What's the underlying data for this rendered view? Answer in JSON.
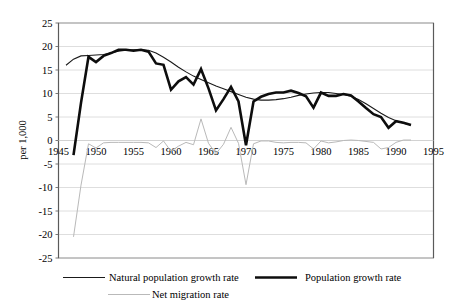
{
  "chart_data": {
    "type": "line",
    "title": "",
    "xlabel": "",
    "ylabel": "per 1,000",
    "xlim": [
      1945,
      1995
    ],
    "ylim": [
      -25,
      25
    ],
    "xticks": [
      "1945",
      "1950",
      "1955",
      "1960",
      "1965",
      "1970",
      "1975",
      "1980",
      "1985",
      "1990",
      "1995"
    ],
    "yticks": [
      "25",
      "20",
      "15",
      "10",
      "5",
      "0",
      "-5",
      "-10",
      "-15",
      "-20",
      "-25"
    ],
    "grid": "horizontal",
    "legend_position": "bottom",
    "series": [
      {
        "name": "Natural population growth rate",
        "style": "thin-black",
        "color": "#1a1a1a",
        "width": 1.1,
        "x": [
          1946,
          1947,
          1948,
          1949,
          1950,
          1951,
          1952,
          1953,
          1954,
          1955,
          1956,
          1957,
          1958,
          1959,
          1960,
          1961,
          1962,
          1963,
          1964,
          1965,
          1966,
          1967,
          1968,
          1969,
          1970,
          1971,
          1972,
          1973,
          1974,
          1975,
          1976,
          1977,
          1978,
          1979,
          1980,
          1981,
          1982,
          1983,
          1984,
          1985,
          1986,
          1987,
          1988,
          1989,
          1990,
          1991,
          1992
        ],
        "values": [
          16.0,
          17.3,
          18.0,
          18.1,
          18.2,
          18.3,
          18.6,
          19.0,
          19.2,
          19.3,
          19.3,
          19.2,
          18.6,
          17.7,
          16.7,
          15.6,
          14.6,
          13.7,
          13.0,
          12.3,
          11.6,
          11.0,
          10.4,
          9.8,
          9.2,
          8.8,
          8.6,
          8.6,
          8.7,
          8.9,
          9.2,
          9.6,
          9.9,
          10.1,
          10.2,
          10.2,
          10.0,
          9.8,
          9.4,
          8.7,
          7.8,
          6.8,
          5.8,
          4.9,
          4.2,
          3.7,
          3.3
        ]
      },
      {
        "name": "Population growth rate",
        "style": "thick-black",
        "color": "#0d0d0d",
        "width": 2.6,
        "x": [
          1947,
          1948,
          1949,
          1950,
          1951,
          1952,
          1953,
          1954,
          1955,
          1956,
          1957,
          1958,
          1959,
          1960,
          1961,
          1962,
          1963,
          1964,
          1965,
          1966,
          1967,
          1968,
          1969,
          1970,
          1971,
          1972,
          1973,
          1974,
          1975,
          1976,
          1977,
          1978,
          1979,
          1980,
          1981,
          1982,
          1983,
          1984,
          1985,
          1986,
          1987,
          1988,
          1989,
          1990,
          1991,
          1992
        ],
        "values": [
          -3.1,
          8.0,
          17.8,
          16.7,
          18.0,
          18.6,
          19.3,
          19.3,
          19.1,
          19.3,
          18.9,
          16.4,
          16.1,
          10.8,
          12.6,
          13.5,
          11.9,
          15.2,
          11.1,
          6.4,
          8.8,
          11.4,
          8.3,
          -1.0,
          8.3,
          9.3,
          9.9,
          10.2,
          10.2,
          10.6,
          10.1,
          9.4,
          7.0,
          10.2,
          9.5,
          9.5,
          9.9,
          9.6,
          8.3,
          6.9,
          5.6,
          5.0,
          2.7,
          4.1,
          3.8,
          3.3
        ]
      },
      {
        "name": "Net migration rate",
        "style": "thin-gray",
        "color": "#b9b9b9",
        "width": 1.0,
        "x": [
          1947,
          1948,
          1949,
          1950,
          1951,
          1952,
          1953,
          1954,
          1955,
          1956,
          1957,
          1958,
          1959,
          1960,
          1961,
          1962,
          1963,
          1964,
          1965,
          1966,
          1967,
          1968,
          1969,
          1970,
          1971,
          1972,
          1973,
          1974,
          1975,
          1976,
          1977,
          1978,
          1979,
          1980,
          1981,
          1982,
          1983,
          1984,
          1985,
          1986,
          1987,
          1988,
          1989,
          1990,
          1991,
          1992
        ],
        "values": [
          -20.5,
          -9.5,
          -0.7,
          -1.6,
          -0.5,
          -0.4,
          -0.4,
          -0.4,
          -0.4,
          -0.4,
          -0.5,
          -1.5,
          -0.1,
          -2.3,
          -1.2,
          -0.4,
          -0.9,
          4.6,
          -0.6,
          -2.8,
          -0.8,
          2.8,
          -0.6,
          -9.4,
          -0.7,
          -0.1,
          -0.1,
          -0.4,
          -0.5,
          -0.4,
          -0.4,
          -0.5,
          -1.8,
          -0.1,
          -0.5,
          -0.3,
          0.0,
          0.1,
          0.0,
          -0.2,
          -0.4,
          -1.8,
          -1.5,
          -0.4,
          0.1,
          0.1
        ]
      }
    ]
  },
  "axis": {
    "ylabel": "per 1,000"
  },
  "legend": {
    "items": [
      {
        "label": "Natural population growth rate"
      },
      {
        "label": "Population growth rate"
      },
      {
        "label": "Net migration rate"
      }
    ]
  }
}
